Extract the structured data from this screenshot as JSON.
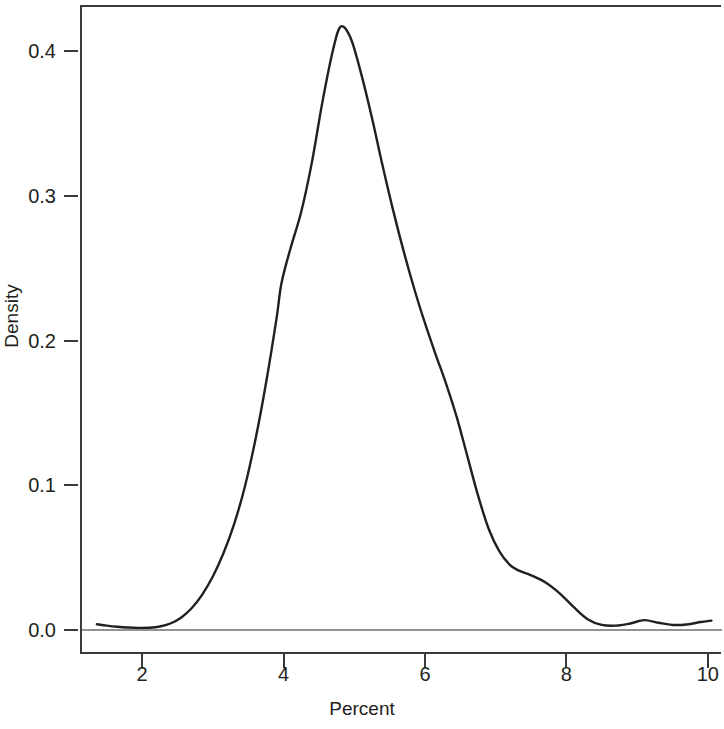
{
  "chart_data": {
    "type": "line",
    "title": "",
    "subtitle": "",
    "xlabel": "Percent",
    "ylabel": "Density",
    "xlim": [
      1.15,
      10.2
    ],
    "ylim": [
      -0.0165,
      0.4455
    ],
    "xticks": [
      2,
      4,
      6,
      8,
      10
    ],
    "xtick_labels": [
      "2",
      "4",
      "6",
      "8",
      "10"
    ],
    "yticks": [
      0.0,
      0.1,
      0.2,
      0.3,
      0.4
    ],
    "ytick_labels": [
      "0.0",
      "0.1",
      "0.2",
      "0.3",
      "0.4"
    ],
    "grid": false,
    "legend": null,
    "series": [
      {
        "name": "Density",
        "color": "#231f20",
        "line_width": 2.4,
        "x": [
          1.36,
          1.5,
          1.65,
          1.8,
          1.95,
          2.1,
          2.25,
          2.4,
          2.55,
          2.7,
          2.85,
          3.0,
          3.15,
          3.3,
          3.45,
          3.6,
          3.75,
          3.9,
          3.97,
          4.1,
          4.25,
          4.4,
          4.55,
          4.7,
          4.81,
          4.95,
          5.1,
          5.25,
          5.4,
          5.55,
          5.7,
          5.85,
          6.0,
          6.15,
          6.3,
          6.45,
          6.6,
          6.75,
          6.9,
          7.05,
          7.2,
          7.32,
          7.5,
          7.7,
          7.9,
          8.1,
          8.3,
          8.5,
          8.7,
          8.9,
          9.1,
          9.3,
          9.5,
          9.7,
          9.9,
          10.05
        ],
        "y": [
          0.004,
          0.003,
          0.0022,
          0.0017,
          0.0015,
          0.0016,
          0.0024,
          0.0045,
          0.0085,
          0.015,
          0.0245,
          0.037,
          0.053,
          0.073,
          0.0985,
          0.131,
          0.17,
          0.215,
          0.2395,
          0.264,
          0.289,
          0.323,
          0.365,
          0.401,
          0.417,
          0.409,
          0.384,
          0.354,
          0.321,
          0.29,
          0.2615,
          0.2355,
          0.212,
          0.1905,
          0.17,
          0.147,
          0.12,
          0.093,
          0.07,
          0.0545,
          0.045,
          0.0412,
          0.0378,
          0.033,
          0.0255,
          0.016,
          0.0075,
          0.0035,
          0.003,
          0.0045,
          0.0068,
          0.005,
          0.0035,
          0.0038,
          0.0055,
          0.0065
        ]
      }
    ],
    "baseline": {
      "value": 0.0,
      "color": "#6e6e6e",
      "description": "horizontal reference line at density 0.0 spanning plot width"
    }
  },
  "axes": {
    "y_title": "Density",
    "x_title": "Percent"
  }
}
